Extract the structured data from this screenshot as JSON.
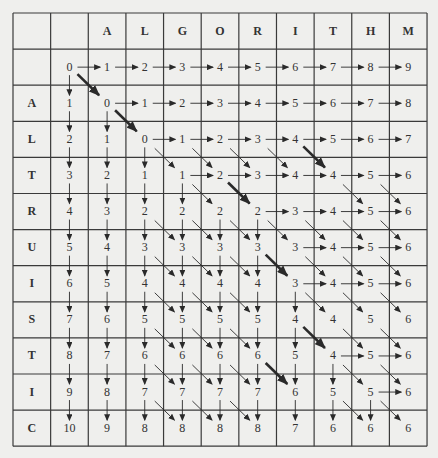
{
  "table": {
    "title": "Edit distance table: ALTRUISTIC vs ALGORITHM",
    "column_headers": [
      "",
      "",
      "A",
      "L",
      "G",
      "O",
      "R",
      "I",
      "T",
      "H",
      "M"
    ],
    "row_headers": [
      "",
      "A",
      "L",
      "T",
      "R",
      "U",
      "I",
      "S",
      "T",
      "I",
      "C"
    ],
    "values": [
      [
        0,
        1,
        2,
        3,
        4,
        5,
        6,
        7,
        8,
        9
      ],
      [
        1,
        0,
        1,
        2,
        3,
        4,
        5,
        6,
        7,
        8
      ],
      [
        2,
        1,
        0,
        1,
        2,
        3,
        4,
        5,
        6,
        7
      ],
      [
        3,
        2,
        1,
        1,
        2,
        3,
        4,
        4,
        5,
        6
      ],
      [
        4,
        3,
        2,
        2,
        2,
        2,
        3,
        4,
        5,
        6
      ],
      [
        5,
        4,
        3,
        3,
        3,
        3,
        3,
        4,
        5,
        6
      ],
      [
        6,
        5,
        4,
        4,
        4,
        4,
        3,
        4,
        5,
        6
      ],
      [
        7,
        6,
        5,
        5,
        5,
        5,
        4,
        4,
        5,
        6
      ],
      [
        8,
        7,
        6,
        6,
        6,
        6,
        5,
        4,
        5,
        6
      ],
      [
        9,
        8,
        7,
        7,
        7,
        7,
        6,
        5,
        5,
        6
      ],
      [
        10,
        9,
        8,
        8,
        8,
        8,
        7,
        6,
        6,
        6
      ]
    ],
    "arrows": {
      "right": [
        [
          0,
          0
        ],
        [
          0,
          1
        ],
        [
          0,
          2
        ],
        [
          0,
          3
        ],
        [
          0,
          4
        ],
        [
          0,
          5
        ],
        [
          0,
          6
        ],
        [
          0,
          7
        ],
        [
          0,
          8
        ],
        [
          1,
          1
        ],
        [
          1,
          2
        ],
        [
          1,
          3
        ],
        [
          1,
          4
        ],
        [
          1,
          5
        ],
        [
          1,
          6
        ],
        [
          1,
          7
        ],
        [
          1,
          8
        ],
        [
          2,
          2
        ],
        [
          2,
          3
        ],
        [
          2,
          4
        ],
        [
          2,
          5
        ],
        [
          2,
          6
        ],
        [
          2,
          7
        ],
        [
          2,
          8
        ],
        [
          3,
          3
        ],
        [
          3,
          4
        ],
        [
          3,
          5
        ],
        [
          3,
          6
        ],
        [
          3,
          7
        ],
        [
          3,
          8
        ],
        [
          4,
          5
        ],
        [
          4,
          6
        ],
        [
          4,
          7
        ],
        [
          4,
          8
        ],
        [
          5,
          6
        ],
        [
          5,
          7
        ],
        [
          5,
          8
        ],
        [
          6,
          6
        ],
        [
          6,
          7
        ],
        [
          6,
          8
        ],
        [
          8,
          7
        ],
        [
          8,
          8
        ],
        [
          9,
          8
        ]
      ],
      "down": [
        [
          0,
          0
        ],
        [
          1,
          0
        ],
        [
          1,
          1
        ],
        [
          2,
          0
        ],
        [
          2,
          1
        ],
        [
          2,
          2
        ],
        [
          3,
          0
        ],
        [
          3,
          1
        ],
        [
          3,
          2
        ],
        [
          3,
          3
        ],
        [
          4,
          0
        ],
        [
          4,
          1
        ],
        [
          4,
          2
        ],
        [
          4,
          3
        ],
        [
          4,
          4
        ],
        [
          4,
          5
        ],
        [
          5,
          0
        ],
        [
          5,
          1
        ],
        [
          5,
          2
        ],
        [
          5,
          3
        ],
        [
          5,
          4
        ],
        [
          5,
          5
        ],
        [
          6,
          0
        ],
        [
          6,
          1
        ],
        [
          6,
          2
        ],
        [
          6,
          3
        ],
        [
          6,
          4
        ],
        [
          6,
          5
        ],
        [
          6,
          6
        ],
        [
          7,
          0
        ],
        [
          7,
          1
        ],
        [
          7,
          2
        ],
        [
          7,
          3
        ],
        [
          7,
          4
        ],
        [
          7,
          5
        ],
        [
          7,
          6
        ],
        [
          8,
          0
        ],
        [
          8,
          1
        ],
        [
          8,
          2
        ],
        [
          8,
          3
        ],
        [
          8,
          4
        ],
        [
          8,
          5
        ],
        [
          8,
          6
        ],
        [
          8,
          7
        ],
        [
          9,
          0
        ],
        [
          9,
          1
        ],
        [
          9,
          2
        ],
        [
          9,
          3
        ],
        [
          9,
          4
        ],
        [
          9,
          5
        ],
        [
          9,
          6
        ],
        [
          9,
          7
        ],
        [
          9,
          8
        ]
      ],
      "diagonal": [
        [
          2,
          2
        ],
        [
          2,
          3
        ],
        [
          2,
          4
        ],
        [
          2,
          5
        ],
        [
          3,
          3
        ],
        [
          3,
          7
        ],
        [
          3,
          8
        ],
        [
          4,
          2
        ],
        [
          4,
          3
        ],
        [
          4,
          4
        ],
        [
          4,
          5
        ],
        [
          4,
          6
        ],
        [
          4,
          7
        ],
        [
          4,
          8
        ],
        [
          5,
          2
        ],
        [
          5,
          3
        ],
        [
          5,
          4
        ],
        [
          5,
          6
        ],
        [
          5,
          7
        ],
        [
          5,
          8
        ],
        [
          6,
          2
        ],
        [
          6,
          3
        ],
        [
          6,
          4
        ],
        [
          6,
          6
        ],
        [
          6,
          7
        ],
        [
          6,
          8
        ],
        [
          7,
          2
        ],
        [
          7,
          3
        ],
        [
          7,
          4
        ],
        [
          7,
          7
        ],
        [
          7,
          8
        ],
        [
          8,
          2
        ],
        [
          8,
          3
        ],
        [
          8,
          4
        ],
        [
          8,
          7
        ],
        [
          8,
          8
        ],
        [
          9,
          2
        ],
        [
          9,
          3
        ],
        [
          9,
          4
        ],
        [
          9,
          7
        ],
        [
          9,
          8
        ]
      ],
      "thick_diagonal": [
        [
          0,
          0
        ],
        [
          1,
          1
        ],
        [
          2,
          6
        ],
        [
          3,
          4
        ],
        [
          5,
          5
        ],
        [
          7,
          6
        ],
        [
          8,
          5
        ]
      ]
    },
    "colors": {
      "background": "#efefed",
      "grid_line": "#3a3a3a",
      "arrow": "#2a2a2a",
      "text": "#333333"
    }
  }
}
